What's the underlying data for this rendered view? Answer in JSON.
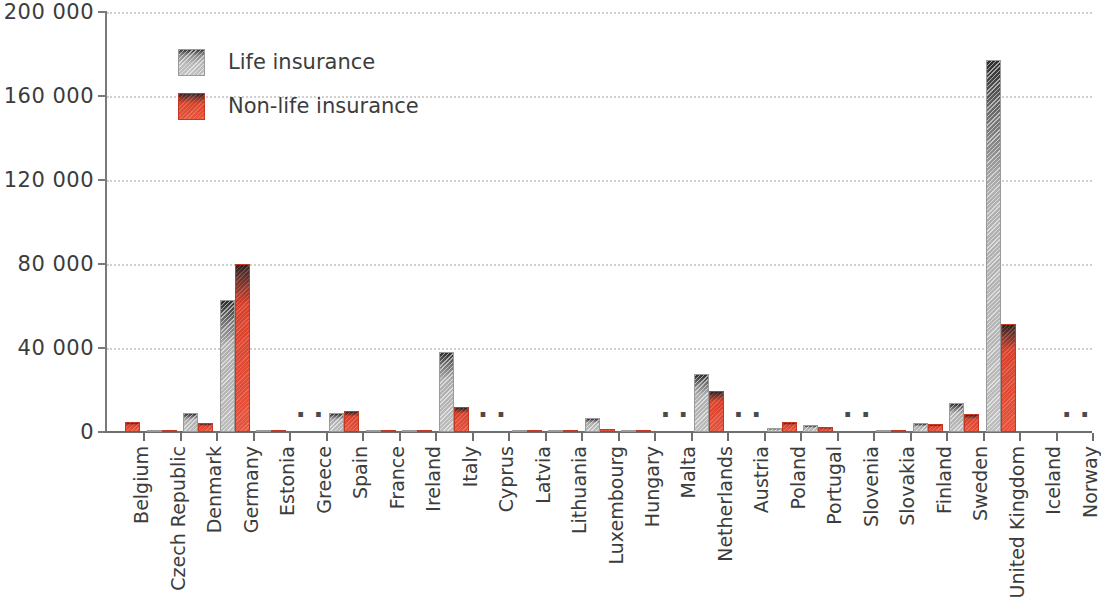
{
  "chart_data": {
    "type": "bar",
    "title": "",
    "subtitle": "",
    "xlabel": "",
    "ylabel": "",
    "ylim": [
      0,
      200000
    ],
    "yticks": [
      0,
      40000,
      80000,
      120000,
      160000,
      200000
    ],
    "ytick_labels": [
      "0",
      "40 000",
      "80 000",
      "120 000",
      "160 000",
      "200 000"
    ],
    "grid": true,
    "legend_position": "upper-left",
    "missing_value_symbol": ":",
    "categories": [
      "Belgium",
      "Czech Republic",
      "Denmark",
      "Germany",
      "Estonia",
      "Greece",
      "Spain",
      "France",
      "Ireland",
      "Italy",
      "Cyprus",
      "Latvia",
      "Lithuania",
      "Luxembourg",
      "Hungary",
      "Malta",
      "Netherlands",
      "Austria",
      "Poland",
      "Portugal",
      "Slovenia",
      "Slovakia",
      "Finland",
      "Sweden",
      "United Kingdom",
      "Iceland",
      "Norway"
    ],
    "series": [
      {
        "name": "Life insurance",
        "color": "#b4b4b4",
        "values": [
          null,
          200,
          9000,
          63000,
          100,
          null,
          9000,
          400,
          300,
          38000,
          null,
          200,
          300,
          6500,
          200,
          null,
          27500,
          null,
          2000,
          3500,
          null,
          300,
          4500,
          14000,
          177000,
          0,
          null
        ]
      },
      {
        "name": "Non-life insurance",
        "color": "#e8452c",
        "values": [
          5000,
          600,
          4500,
          80000,
          300,
          null,
          10000,
          700,
          500,
          12000,
          null,
          400,
          500,
          1200,
          400,
          null,
          19500,
          null,
          5000,
          2500,
          null,
          500,
          4000,
          8500,
          51500,
          0,
          null
        ]
      }
    ],
    "missing_categories": [
      "Greece",
      "Cyprus",
      "Malta",
      "Austria",
      "Slovenia",
      "Norway"
    ],
    "legend": [
      {
        "label": "Life insurance",
        "swatch": "life"
      },
      {
        "label": "Non-life insurance",
        "swatch": "nonlife"
      }
    ]
  }
}
